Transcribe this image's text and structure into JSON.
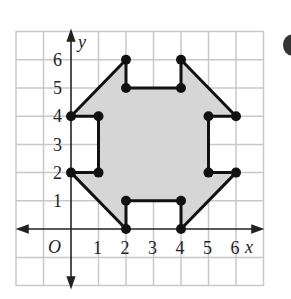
{
  "diagram": {
    "axis_labels": {
      "x": "x",
      "y": "y",
      "origin": "O"
    },
    "x_ticks": [
      "1",
      "2",
      "3",
      "4",
      "5",
      "6"
    ],
    "y_ticks": [
      "1",
      "2",
      "3",
      "4",
      "5",
      "6"
    ],
    "polygon_vertices": [
      [
        0,
        4
      ],
      [
        2,
        6
      ],
      [
        2,
        5
      ],
      [
        4,
        5
      ],
      [
        4,
        6
      ],
      [
        6,
        4
      ],
      [
        5,
        4
      ],
      [
        5,
        2
      ],
      [
        6,
        2
      ],
      [
        4,
        0
      ],
      [
        4,
        1
      ],
      [
        2,
        1
      ],
      [
        2,
        0
      ],
      [
        0,
        2
      ],
      [
        1,
        2
      ],
      [
        1,
        4
      ]
    ],
    "fill_color": "#d6d6d6",
    "line_color": "#111111"
  }
}
